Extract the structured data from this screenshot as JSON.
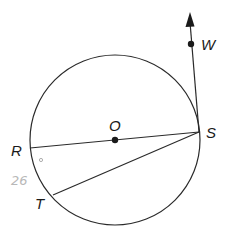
{
  "diagram": {
    "type": "circle-geometry",
    "circle": {
      "center_label": "O"
    },
    "points": {
      "O": "O",
      "R": "R",
      "S": "S",
      "T": "T",
      "W": "W"
    },
    "segments": [
      "RS (diameter through O)",
      "ST (chord)",
      "SW (ray from S through W)"
    ],
    "annotations": {
      "handwritten": "26",
      "degree_mark": "°"
    },
    "colors": {
      "stroke": "#2a2a2a",
      "handwriting": "#b8b8b8",
      "background": "#ffffff"
    }
  }
}
